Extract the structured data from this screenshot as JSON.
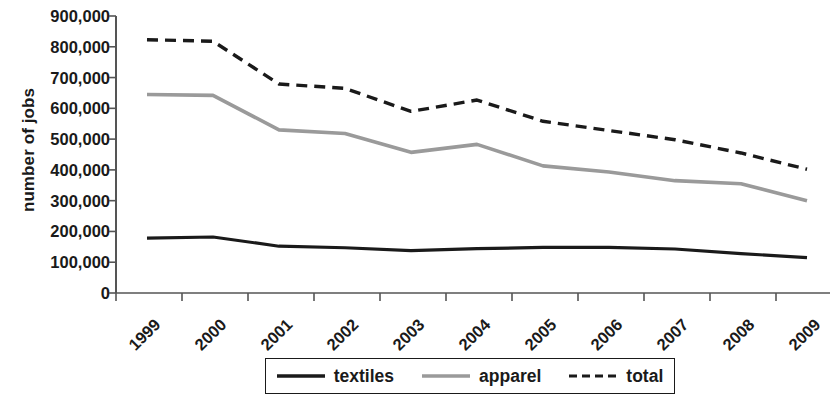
{
  "chart_data": {
    "type": "line",
    "title": "",
    "xlabel": "",
    "ylabel": "number of jobs",
    "categories": [
      "1999",
      "2000",
      "2001",
      "2002",
      "2003",
      "2004",
      "2005",
      "2006",
      "2007",
      "2008",
      "2009"
    ],
    "x": [
      1999,
      2000,
      2001,
      2002,
      2003,
      2004,
      2005,
      2006,
      2007,
      2008,
      2009
    ],
    "ylim": [
      0,
      900000
    ],
    "ytick_values": [
      0,
      100000,
      200000,
      300000,
      400000,
      500000,
      600000,
      700000,
      800000,
      900000
    ],
    "ytick_labels": [
      "0",
      "100,000",
      "200,000",
      "300,000",
      "400,000",
      "500,000",
      "600,000",
      "700,000",
      "800,000",
      "900,000"
    ],
    "grid": false,
    "legend_position": "bottom",
    "series": [
      {
        "name": "textiles",
        "color": "#1a1a1a",
        "style": "solid",
        "values": [
          178000,
          182000,
          152000,
          147000,
          138000,
          144000,
          148000,
          148000,
          143000,
          128000,
          115000
        ]
      },
      {
        "name": "apparel",
        "color": "#9a9a9a",
        "style": "solid",
        "values": [
          645000,
          642000,
          530000,
          518000,
          457000,
          483000,
          413000,
          393000,
          365000,
          355000,
          300000
        ]
      },
      {
        "name": "total",
        "color": "#1a1a1a",
        "style": "dashed",
        "values": [
          823000,
          818000,
          679000,
          665000,
          590000,
          627000,
          558000,
          528000,
          498000,
          455000,
          402000
        ]
      }
    ]
  },
  "legend": {
    "items": [
      {
        "label": "textiles",
        "swatch": "line-solid-black-swatch"
      },
      {
        "label": "apparel",
        "swatch": "line-solid-gray-swatch"
      },
      {
        "label": "total",
        "swatch": "line-dashed-black-swatch"
      }
    ]
  },
  "axes": {
    "y_title": "number of jobs"
  }
}
